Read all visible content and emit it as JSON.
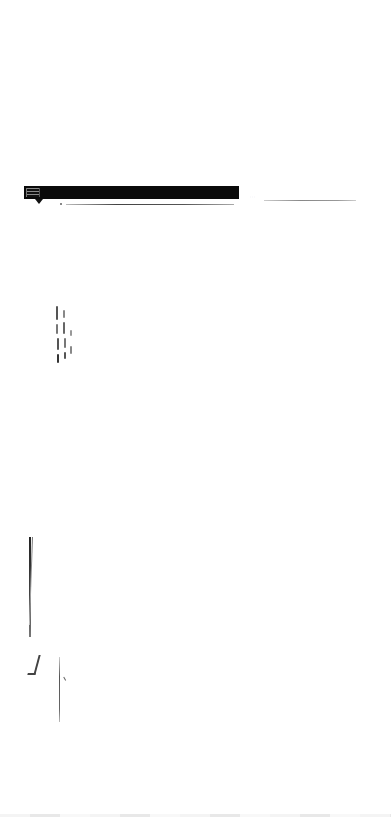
{
  "page": {
    "background_color": "#ffffff"
  },
  "header_bar": {
    "color": "#0a0a0a",
    "text": "[illegible]"
  },
  "header_underline": {
    "left_text": "[illegible]",
    "right_text": "[illegible]"
  },
  "vertical_text_block": {
    "text": "[illegible rotated text]"
  },
  "lower_marks": {
    "text": "[illegible]"
  }
}
